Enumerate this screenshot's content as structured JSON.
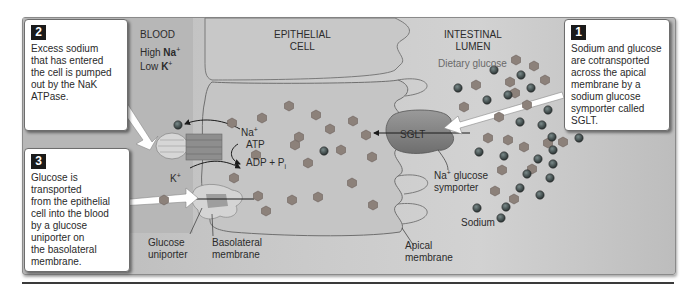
{
  "regions": {
    "blood": "BLOOD",
    "epithelial_cell": "EPITHELIAL\nCELL",
    "intestinal_lumen": "INTESTINAL\nLUMEN"
  },
  "blood_concentration": {
    "high_prefix": "High ",
    "high_ion": "Na",
    "high_charge": "+",
    "low_prefix": "Low ",
    "low_ion": "K",
    "low_charge": "+"
  },
  "labels": {
    "dietary_glucose": "Dietary glucose",
    "sglt": "SGLT",
    "na_glucose_symporter_ion": "Na",
    "na_glucose_symporter_charge": "+",
    "na_glucose_symporter_rest": " glucose",
    "na_glucose_symporter_line2": "symporter",
    "sodium": "Sodium",
    "apical_membrane_line1": "Apical",
    "apical_membrane_line2": "membrane",
    "basolateral_membrane_line1": "Basolateral",
    "basolateral_membrane_line2": "membrane",
    "glucose_uniporter_line1": "Glucose",
    "glucose_uniporter_line2": "uniporter",
    "na_ion": "Na",
    "na_charge": "+",
    "k_ion": "K",
    "k_charge": "+",
    "atp": "ATP",
    "adp_pi": "ADP + P",
    "pi_sub": "i"
  },
  "callouts": [
    {
      "number": "1",
      "text": "Sodium and glucose\nare cotransported\nacross the apical\nmembrane by a\nsodium glucose\nsymporter called\nSGLT."
    },
    {
      "number": "2",
      "text": "Excess sodium\nthat has entered\nthe cell is pumped\nout by the NaK\nATPase."
    },
    {
      "number": "3",
      "text": "Glucose is\ntransported\nfrom the epithelial\ncell into the blood\nby a glucose\nuniporter on\nthe basolateral\nmembrane."
    }
  ],
  "colors": {
    "glucose": "#8a7f78",
    "sodium": "#3f4a4c",
    "cell": "#c7c7c7",
    "panel": "#c4c4c4"
  }
}
